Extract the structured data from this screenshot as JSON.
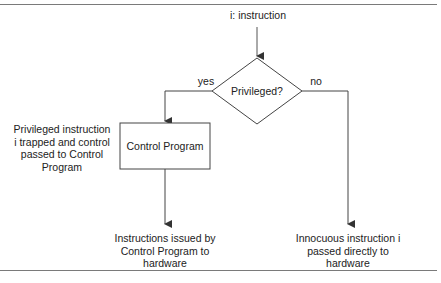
{
  "diagram": {
    "type": "flowchart",
    "colors": {
      "line": "#333333",
      "text": "#222222",
      "rule": "#7a7a7a",
      "background": "#ffffff"
    },
    "start_label": "i: instruction",
    "decision": {
      "label": "Privileged?",
      "yes_label": "yes",
      "no_label": "no"
    },
    "process_box": {
      "label": "Control Program"
    },
    "annotation": {
      "lines": [
        "Privileged instruction",
        "i trapped and control",
        "passed to Control",
        "Program"
      ]
    },
    "outcome_left": {
      "lines": [
        "Instructions issued by",
        "Control Program to",
        "hardware"
      ]
    },
    "outcome_right": {
      "lines": [
        "Innocuous instruction i",
        "passed directly to",
        "hardware"
      ]
    }
  }
}
